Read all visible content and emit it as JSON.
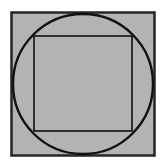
{
  "figure": {
    "title": "Square with inscribed circle and inscribed square",
    "canvas": {
      "width": 163,
      "height": 166,
      "background_color": "#ffffff"
    },
    "colors": {
      "fill_gray": "#b3b3b3",
      "stroke_dark": "#1a1a1a",
      "background_white": "#ffffff"
    },
    "shapes": {
      "outer_square": {
        "name": "outer-square",
        "x": 11.5,
        "y": 12.5,
        "width": 143,
        "height": 143,
        "fill": "#b3b3b3",
        "stroke": "#262626",
        "stroke_width": 2.5
      },
      "circle": {
        "name": "inscribed-circle",
        "cx": 83,
        "cy": 84,
        "r": 70,
        "fill": "none",
        "stroke": "#111111",
        "stroke_width": 2.4
      },
      "inner_square": {
        "name": "inner-square",
        "x": 34,
        "y": 36,
        "width": 98,
        "height": 95,
        "fill": "none",
        "stroke": "#111111",
        "stroke_width": 1.6
      }
    }
  }
}
